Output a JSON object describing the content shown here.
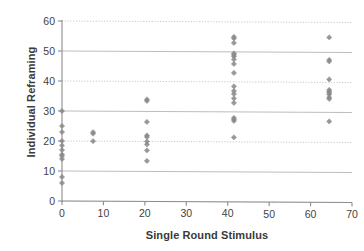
{
  "chart_data": {
    "type": "scatter",
    "title": "",
    "xlabel": "Single Round Stimulus",
    "ylabel": "Individual Reframing",
    "xlim": [
      0,
      70
    ],
    "ylim": [
      0,
      60
    ],
    "xticks": [
      0,
      10,
      20,
      30,
      40,
      50,
      60,
      70
    ],
    "yticks": [
      0,
      10,
      20,
      30,
      40,
      50,
      60
    ],
    "xtick_labels": [
      "0",
      "10",
      "20",
      "30",
      "40",
      "50",
      "60",
      "70"
    ],
    "ytick_labels": [
      "0",
      "10",
      "20",
      "30",
      "40",
      "50",
      "60"
    ],
    "grid": "horizontal",
    "legend": "none",
    "marker": "diamond",
    "marker_color": "#8a8a8a",
    "points": [
      {
        "x": 0,
        "y": 30
      },
      {
        "x": 0,
        "y": 25
      },
      {
        "x": 0,
        "y": 23
      },
      {
        "x": 0,
        "y": 20
      },
      {
        "x": 0,
        "y": 18.5
      },
      {
        "x": 0,
        "y": 17
      },
      {
        "x": 0,
        "y": 15.5
      },
      {
        "x": 0,
        "y": 15
      },
      {
        "x": 0,
        "y": 14
      },
      {
        "x": 0,
        "y": 8
      },
      {
        "x": 0,
        "y": 6
      },
      {
        "x": 7.5,
        "y": 23
      },
      {
        "x": 7.5,
        "y": 22.5
      },
      {
        "x": 7.5,
        "y": 20
      },
      {
        "x": 20.5,
        "y": 34
      },
      {
        "x": 20.5,
        "y": 33.5
      },
      {
        "x": 20.5,
        "y": 26.5
      },
      {
        "x": 20.5,
        "y": 22
      },
      {
        "x": 20.5,
        "y": 21.5
      },
      {
        "x": 20.5,
        "y": 20
      },
      {
        "x": 20.5,
        "y": 19
      },
      {
        "x": 20.5,
        "y": 17
      },
      {
        "x": 20.5,
        "y": 13.5
      },
      {
        "x": 41.5,
        "y": 55
      },
      {
        "x": 41.5,
        "y": 54.5
      },
      {
        "x": 41.5,
        "y": 53
      },
      {
        "x": 41.5,
        "y": 49.5
      },
      {
        "x": 41.5,
        "y": 49
      },
      {
        "x": 41.5,
        "y": 48.5
      },
      {
        "x": 41.5,
        "y": 47.5
      },
      {
        "x": 41.5,
        "y": 46
      },
      {
        "x": 41.5,
        "y": 43
      },
      {
        "x": 41.5,
        "y": 38.5
      },
      {
        "x": 41.5,
        "y": 37
      },
      {
        "x": 41.5,
        "y": 36
      },
      {
        "x": 41.5,
        "y": 34.5
      },
      {
        "x": 41.5,
        "y": 33
      },
      {
        "x": 41.5,
        "y": 28
      },
      {
        "x": 41.5,
        "y": 27.5
      },
      {
        "x": 41.5,
        "y": 27
      },
      {
        "x": 41.5,
        "y": 21.5
      },
      {
        "x": 64.5,
        "y": 55
      },
      {
        "x": 64.5,
        "y": 47.5
      },
      {
        "x": 64.5,
        "y": 47
      },
      {
        "x": 64.5,
        "y": 41
      },
      {
        "x": 64.5,
        "y": 37.5
      },
      {
        "x": 64.5,
        "y": 37
      },
      {
        "x": 64.5,
        "y": 36.5
      },
      {
        "x": 64.5,
        "y": 36
      },
      {
        "x": 64.5,
        "y": 35
      },
      {
        "x": 64.5,
        "y": 34.5
      },
      {
        "x": 64.5,
        "y": 27
      }
    ]
  },
  "colors": {
    "marker": "#8a8a8a",
    "gridline_solid": "#b4b4b4",
    "gridline_dotted": "#c8c8c8",
    "axis": "#8c8c8c",
    "text": "#3a3a3a",
    "background": "#ffffff"
  }
}
